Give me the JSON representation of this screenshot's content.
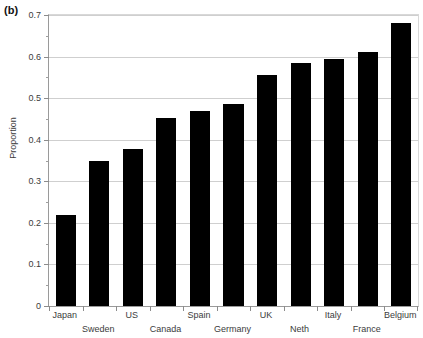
{
  "panel": {
    "label": "(b)"
  },
  "axes": {
    "ylabel": "Proportion",
    "xlabel": "",
    "y_ticks": [
      "0",
      "0.1",
      "0.2",
      "0.3",
      "0.4",
      "0.5",
      "0.6",
      "0.7"
    ]
  },
  "chart_data": {
    "type": "bar",
    "title": "",
    "subtitle": "",
    "xlabel": "",
    "ylabel": "Proportion",
    "ylim": [
      0,
      0.7
    ],
    "xlim": [
      0,
      11
    ],
    "grid": "horizontal-major",
    "legend": "none",
    "bar_color": "#000000",
    "y_major_step": 0.1,
    "y_minor_step": 0.05,
    "categories": [
      "Japan",
      "Sweden",
      "US",
      "Canada",
      "Spain",
      "Germany",
      "UK",
      "Neth",
      "Italy",
      "France",
      "Belgium"
    ],
    "values": [
      0.22,
      0.35,
      0.378,
      0.453,
      0.47,
      0.487,
      0.555,
      0.585,
      0.595,
      0.61,
      0.68
    ],
    "label_rows": [
      "top",
      "bottom",
      "top",
      "bottom",
      "top",
      "bottom",
      "top",
      "bottom",
      "top",
      "bottom",
      "top"
    ]
  }
}
